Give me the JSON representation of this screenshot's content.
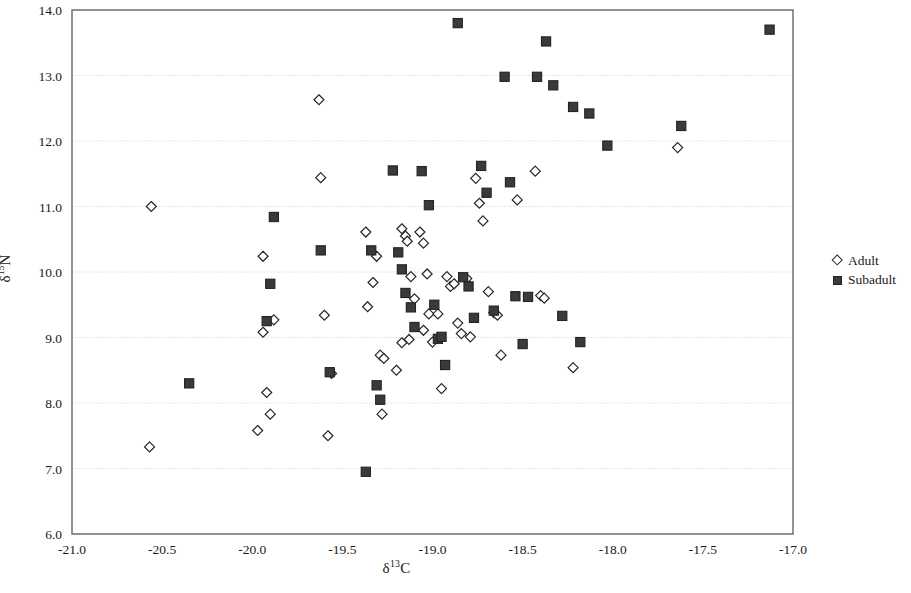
{
  "figure": {
    "background": "#ffffff",
    "plot_area": {
      "left": 72,
      "top": 10,
      "right": 793,
      "bottom": 534
    }
  },
  "axes": {
    "x_label_html": "&delta;<sup>13</sup>C",
    "y_label_html": "&delta;<sup>15</sup>N",
    "x_ticks": [
      "-21.0",
      "-20.5",
      "-20.0",
      "-19.5",
      "-19.0",
      "-18.5",
      "-18.0",
      "-17.5",
      "-17.0"
    ],
    "y_ticks": [
      "14.0",
      "13.0",
      "12.0",
      "11.0",
      "10.0",
      "9.0",
      "8.0",
      "7.0",
      "6.0"
    ]
  },
  "legend": {
    "position": "right",
    "entries": [
      {
        "label": "Adult",
        "marker": "open-diamond",
        "color": "#ffffff",
        "edge": "#262626"
      },
      {
        "label": "Subadult",
        "marker": "filled-square",
        "color": "#3a3a3a",
        "edge": "#222222"
      }
    ]
  },
  "chart_data": {
    "type": "scatter",
    "title": "",
    "xlabel": "δ13C",
    "ylabel": "δ15N",
    "xlim": [
      -21.0,
      -17.0
    ],
    "ylim": [
      6.0,
      14.0
    ],
    "xticks": [
      -21.0,
      -20.5,
      -20.0,
      -19.5,
      -19.0,
      -18.5,
      -18.0,
      -17.5,
      -17.0
    ],
    "yticks": [
      6.0,
      7.0,
      8.0,
      9.0,
      10.0,
      11.0,
      12.0,
      13.0,
      14.0
    ],
    "grid": "horizontal",
    "legend_position": "right",
    "series": [
      {
        "name": "Adult",
        "marker": "open-diamond",
        "color": "#ffffff",
        "edge_color": "#262626",
        "points": [
          [
            -20.56,
            11.0
          ],
          [
            -20.57,
            7.33
          ],
          [
            -19.94,
            10.24
          ],
          [
            -19.94,
            9.08
          ],
          [
            -19.88,
            9.27
          ],
          [
            -19.97,
            7.58
          ],
          [
            -19.92,
            8.16
          ],
          [
            -19.9,
            7.83
          ],
          [
            -19.63,
            12.63
          ],
          [
            -19.62,
            11.44
          ],
          [
            -19.6,
            9.34
          ],
          [
            -19.58,
            7.5
          ],
          [
            -19.56,
            8.45
          ],
          [
            -19.37,
            10.61
          ],
          [
            -19.36,
            9.47
          ],
          [
            -19.33,
            9.84
          ],
          [
            -19.31,
            10.24
          ],
          [
            -19.29,
            8.73
          ],
          [
            -19.27,
            8.68
          ],
          [
            -19.28,
            7.83
          ],
          [
            -19.17,
            10.66
          ],
          [
            -19.15,
            10.55
          ],
          [
            -19.14,
            10.47
          ],
          [
            -19.12,
            9.93
          ],
          [
            -19.1,
            9.59
          ],
          [
            -19.13,
            8.97
          ],
          [
            -19.17,
            8.92
          ],
          [
            -19.2,
            8.5
          ],
          [
            -19.07,
            10.61
          ],
          [
            -19.05,
            10.44
          ],
          [
            -19.03,
            9.97
          ],
          [
            -19.02,
            9.36
          ],
          [
            -19.05,
            9.11
          ],
          [
            -19.0,
            8.93
          ],
          [
            -18.97,
            9.36
          ],
          [
            -18.95,
            8.22
          ],
          [
            -18.92,
            9.93
          ],
          [
            -18.9,
            9.78
          ],
          [
            -18.88,
            9.82
          ],
          [
            -18.86,
            9.22
          ],
          [
            -18.84,
            9.06
          ],
          [
            -18.81,
            9.9
          ],
          [
            -18.79,
            9.01
          ],
          [
            -18.76,
            11.43
          ],
          [
            -18.74,
            11.05
          ],
          [
            -18.72,
            10.78
          ],
          [
            -18.69,
            9.7
          ],
          [
            -18.66,
            9.38
          ],
          [
            -18.64,
            9.34
          ],
          [
            -18.62,
            8.73
          ],
          [
            -18.53,
            11.1
          ],
          [
            -18.43,
            11.54
          ],
          [
            -18.4,
            9.64
          ],
          [
            -18.38,
            9.6
          ],
          [
            -18.22,
            8.54
          ],
          [
            -17.64,
            11.9
          ]
        ]
      },
      {
        "name": "Subadult",
        "marker": "filled-square",
        "color": "#3a3a3a",
        "edge_color": "#222222",
        "points": [
          [
            -20.35,
            8.3
          ],
          [
            -19.88,
            10.84
          ],
          [
            -19.9,
            9.82
          ],
          [
            -19.92,
            9.25
          ],
          [
            -19.62,
            10.33
          ],
          [
            -19.57,
            8.47
          ],
          [
            -19.37,
            6.95
          ],
          [
            -19.34,
            10.33
          ],
          [
            -19.31,
            8.27
          ],
          [
            -19.29,
            8.05
          ],
          [
            -19.22,
            11.55
          ],
          [
            -19.19,
            10.3
          ],
          [
            -19.17,
            10.04
          ],
          [
            -19.15,
            9.68
          ],
          [
            -19.12,
            9.46
          ],
          [
            -19.1,
            9.16
          ],
          [
            -19.06,
            11.54
          ],
          [
            -19.02,
            11.02
          ],
          [
            -18.99,
            9.5
          ],
          [
            -18.97,
            8.98
          ],
          [
            -18.95,
            9.01
          ],
          [
            -18.93,
            8.58
          ],
          [
            -18.86,
            13.8
          ],
          [
            -18.83,
            9.92
          ],
          [
            -18.8,
            9.78
          ],
          [
            -18.77,
            9.3
          ],
          [
            -18.73,
            11.62
          ],
          [
            -18.7,
            11.21
          ],
          [
            -18.66,
            9.41
          ],
          [
            -18.6,
            12.98
          ],
          [
            -18.57,
            11.37
          ],
          [
            -18.54,
            9.63
          ],
          [
            -18.5,
            8.9
          ],
          [
            -18.47,
            9.62
          ],
          [
            -18.42,
            12.98
          ],
          [
            -18.37,
            13.52
          ],
          [
            -18.33,
            12.85
          ],
          [
            -18.28,
            9.33
          ],
          [
            -18.22,
            12.52
          ],
          [
            -18.18,
            8.93
          ],
          [
            -18.13,
            12.42
          ],
          [
            -18.03,
            11.93
          ],
          [
            -17.62,
            12.23
          ],
          [
            -17.13,
            13.7
          ]
        ]
      }
    ]
  }
}
